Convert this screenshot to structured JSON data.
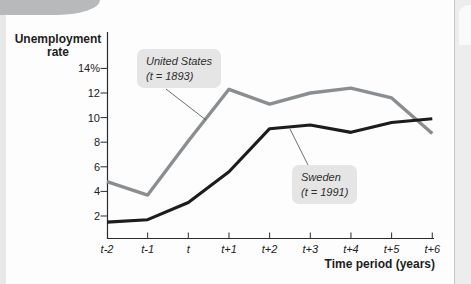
{
  "chart": {
    "y_title_line1": "Unemployment",
    "y_title_line2": "rate",
    "x_title": "Time period (years)"
  },
  "chart_data": {
    "type": "line",
    "title": "",
    "ylabel": "Unemployment rate",
    "xlabel": "Time period (years)",
    "ylim": [
      0,
      15
    ],
    "grid": false,
    "legend_position": "inline-callouts",
    "categories": [
      "t-2",
      "t-1",
      "t",
      "t+1",
      "t+2",
      "t+3",
      "t+4",
      "t+5",
      "t+6"
    ],
    "y_ticks": [
      "14%",
      "12",
      "10",
      "8",
      "6",
      "4",
      "2"
    ],
    "y_tick_values": [
      14,
      12,
      10,
      8,
      6,
      4,
      2
    ],
    "series": [
      {
        "name": "United States",
        "label_line1": "United States",
        "label_line2": "(t = 1893)",
        "color": "#8b8e90",
        "values": [
          4.8,
          3.7,
          8.1,
          12.3,
          11.1,
          12.0,
          12.4,
          11.6,
          8.7
        ]
      },
      {
        "name": "Sweden",
        "label_line1": "Sweden",
        "label_line2": "(t = 1991)",
        "color": "#1c1c1c",
        "values": [
          1.5,
          1.7,
          3.1,
          5.6,
          9.1,
          9.4,
          8.8,
          9.6,
          9.9
        ]
      }
    ],
    "colors": {
      "axis": "#2b2b2b",
      "callout_bg": "#e5e5e5",
      "leader": "#4a4a4a"
    }
  }
}
